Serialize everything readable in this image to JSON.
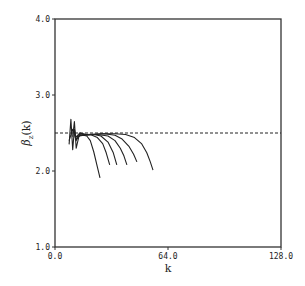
{
  "chart_data": {
    "type": "line",
    "title": "",
    "xlabel": "k",
    "ylabel": "β_z(k)",
    "ylabel_main": "β",
    "ylabel_sub": "z",
    "ylabel_tail": "(k)",
    "xlim": [
      0,
      128
    ],
    "ylim": [
      1.0,
      4.0
    ],
    "grid": false,
    "legend": null,
    "xticks": [
      0,
      64,
      128
    ],
    "xtick_labels": [
      "0.0",
      "64.0",
      "128.0"
    ],
    "yticks": [
      1.0,
      2.0,
      3.0,
      4.0
    ],
    "ytick_labels": [
      "1.0",
      "2.0",
      "3.0",
      "4.0"
    ],
    "reference_line": {
      "y": 2.5,
      "style": "dashed",
      "x_range": [
        0,
        128
      ]
    },
    "series": [
      {
        "name": "curve-1",
        "x": [
          8,
          9,
          10,
          11,
          12,
          14,
          16,
          18,
          20,
          22,
          24,
          25.5
        ],
        "y": [
          2.35,
          2.68,
          2.28,
          2.55,
          2.42,
          2.47,
          2.47,
          2.46,
          2.4,
          2.25,
          2.05,
          1.91
        ]
      },
      {
        "name": "curve-2",
        "x": [
          8,
          10,
          12,
          14,
          16,
          20,
          24,
          27,
          29,
          31
        ],
        "y": [
          2.4,
          2.55,
          2.4,
          2.48,
          2.47,
          2.48,
          2.44,
          2.36,
          2.24,
          2.08
        ]
      },
      {
        "name": "curve-3",
        "x": [
          10,
          11,
          12,
          14,
          18,
          22,
          26,
          30,
          33,
          35
        ],
        "y": [
          2.45,
          2.65,
          2.3,
          2.5,
          2.47,
          2.48,
          2.46,
          2.38,
          2.24,
          2.08
        ]
      },
      {
        "name": "curve-4",
        "x": [
          12,
          14,
          18,
          24,
          30,
          34,
          37,
          39,
          40.7
        ],
        "y": [
          2.45,
          2.5,
          2.48,
          2.48,
          2.46,
          2.4,
          2.3,
          2.2,
          2.08
        ]
      },
      {
        "name": "curve-5",
        "x": [
          12,
          16,
          22,
          28,
          34,
          38,
          42,
          44.5,
          46.4
        ],
        "y": [
          2.45,
          2.48,
          2.48,
          2.49,
          2.47,
          2.42,
          2.32,
          2.22,
          2.12
        ]
      },
      {
        "name": "curve-6",
        "x": [
          12,
          18,
          26,
          34,
          40,
          45,
          49,
          52,
          54,
          55.5
        ],
        "y": [
          2.45,
          2.48,
          2.49,
          2.49,
          2.48,
          2.44,
          2.36,
          2.24,
          2.12,
          2.01
        ]
      }
    ]
  }
}
